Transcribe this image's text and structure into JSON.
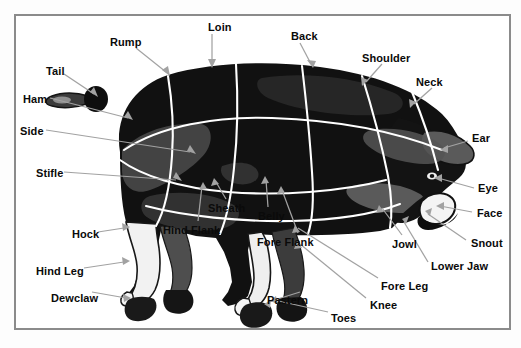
{
  "diagram": {
    "view": "left lateral profile",
    "frame_color": "#8b8b8b",
    "background_color": "#ffffff",
    "leader_line_color": "#9a9a9a",
    "cut_line_color": "#ffffff",
    "body_color": "#141414",
    "label_color": "#0a0a0a"
  },
  "labels": [
    {
      "id": "loin",
      "text": "Loin",
      "x": 208,
      "y": 22
    },
    {
      "id": "back",
      "text": "Back",
      "x": 291,
      "y": 31
    },
    {
      "id": "rump",
      "text": "Rump",
      "x": 110,
      "y": 37
    },
    {
      "id": "shoulder",
      "text": "Shoulder",
      "x": 362,
      "y": 53
    },
    {
      "id": "tail",
      "text": "Tail",
      "x": 46,
      "y": 66
    },
    {
      "id": "neck",
      "text": "Neck",
      "x": 416,
      "y": 77
    },
    {
      "id": "ham",
      "text": "Ham",
      "x": 23,
      "y": 94
    },
    {
      "id": "side",
      "text": "Side",
      "x": 20,
      "y": 126
    },
    {
      "id": "ear",
      "text": "Ear",
      "x": 472,
      "y": 133
    },
    {
      "id": "stifle",
      "text": "Stifle",
      "x": 36,
      "y": 168
    },
    {
      "id": "eye",
      "text": "Eye",
      "x": 478,
      "y": 183
    },
    {
      "id": "sheath",
      "text": "Sheath",
      "x": 208,
      "y": 203
    },
    {
      "id": "belly",
      "text": "Belly",
      "x": 258,
      "y": 211
    },
    {
      "id": "face",
      "text": "Face",
      "x": 477,
      "y": 208
    },
    {
      "id": "hock",
      "text": "Hock",
      "x": 72,
      "y": 229
    },
    {
      "id": "hind-flank",
      "text": "Hind Flank",
      "x": 163,
      "y": 225
    },
    {
      "id": "fore-flank",
      "text": "Fore Flank",
      "x": 257,
      "y": 237
    },
    {
      "id": "jowl",
      "text": "Jowl",
      "x": 392,
      "y": 239
    },
    {
      "id": "snout",
      "text": "Snout",
      "x": 471,
      "y": 238
    },
    {
      "id": "lower-jaw",
      "text": "Lower Jaw",
      "x": 431,
      "y": 261
    },
    {
      "id": "hind-leg",
      "text": "Hind Leg",
      "x": 36,
      "y": 266
    },
    {
      "id": "fore-leg",
      "text": "Fore Leg",
      "x": 381,
      "y": 281
    },
    {
      "id": "pastern",
      "text": "Pastern",
      "x": 267,
      "y": 295
    },
    {
      "id": "dewclaw",
      "text": "Dewclaw",
      "x": 51,
      "y": 293
    },
    {
      "id": "knee",
      "text": "Knee",
      "x": 370,
      "y": 300
    },
    {
      "id": "toes",
      "text": "Toes",
      "x": 331,
      "y": 313
    }
  ]
}
